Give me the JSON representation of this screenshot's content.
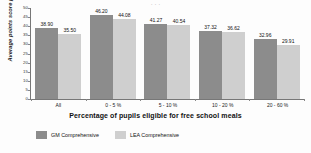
{
  "title_sliver": "· · ·",
  "legend": {
    "position": "bottom-left",
    "items": [
      {
        "label": "GM Comprehensive",
        "color": "#8c8c8c",
        "key": "gm"
      },
      {
        "label": "LEA Comprehensive",
        "color": "#cfcfcf",
        "key": "lea"
      }
    ]
  },
  "axes": {
    "ylabel": "Average points score per pupil",
    "xlabel": "Percentage of pupils eligible for free school meals",
    "yticks": [
      "50",
      "45",
      "40",
      "35",
      "30",
      "25",
      "20",
      "15",
      "10",
      "5",
      "0"
    ]
  },
  "chart_data": {
    "type": "bar",
    "title": "",
    "xlabel": "Percentage of pupils eligible for free school meals",
    "ylabel": "Average points score per pupil",
    "ylim": [
      0,
      50
    ],
    "ytick_step": 5,
    "grid": false,
    "legend_position": "bottom-left",
    "categories": [
      "All",
      "0 - 5 %",
      "5 - 10 %",
      "10 - 20 %",
      "20 - 60 %"
    ],
    "series": [
      {
        "name": "GM Comprehensive",
        "color": "#8c8c8c",
        "values": [
          38.9,
          46.2,
          41.27,
          37.32,
          32.96
        ],
        "labels": [
          "38.90",
          "46.20",
          "41.27",
          "37.32",
          "32.96"
        ]
      },
      {
        "name": "LEA Comprehensive",
        "color": "#cfcfcf",
        "values": [
          35.5,
          44.08,
          40.54,
          36.62,
          29.91
        ],
        "labels": [
          "35.50",
          "44.08",
          "40.54",
          "36.62",
          "29.91"
        ]
      }
    ]
  }
}
